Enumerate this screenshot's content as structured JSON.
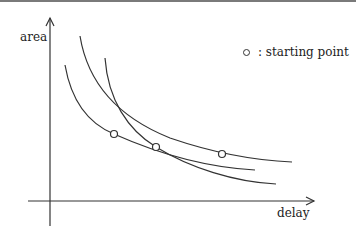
{
  "diagram": {
    "y_axis_label": "area",
    "x_axis_label": "delay",
    "legend": {
      "marker": "open-circle",
      "text": ": starting point"
    },
    "curves": [
      {
        "name": "curve-1",
        "start": [
          65,
          65
        ],
        "end": [
          255,
          170
        ],
        "starting_point": [
          114,
          134
        ]
      },
      {
        "name": "curve-2",
        "start": [
          80,
          36
        ],
        "end": [
          292,
          162
        ],
        "starting_point": [
          222,
          154
        ]
      },
      {
        "name": "curve-3",
        "start": [
          105,
          58
        ],
        "end": [
          276,
          184
        ],
        "starting_point": [
          156,
          147
        ]
      }
    ],
    "line_color": "#333333"
  }
}
